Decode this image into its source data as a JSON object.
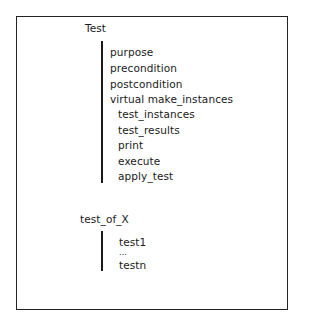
{
  "diagram": {
    "root": {
      "label": "Test",
      "members": [
        {
          "label": "purpose",
          "indent": 0
        },
        {
          "label": "precondition",
          "indent": 0
        },
        {
          "label": "postcondition",
          "indent": 0
        },
        {
          "label": "virtual make_instances",
          "indent": 0
        },
        {
          "label": "test_instances",
          "indent": 1
        },
        {
          "label": "test_results",
          "indent": 1
        },
        {
          "label": "print",
          "indent": 1
        },
        {
          "label": "execute",
          "indent": 1
        },
        {
          "label": "apply_test",
          "indent": 1
        }
      ]
    },
    "child": {
      "label": "test_of_X",
      "members": [
        {
          "label": "test1"
        },
        {
          "label": "..."
        },
        {
          "label": "testn"
        }
      ]
    }
  }
}
